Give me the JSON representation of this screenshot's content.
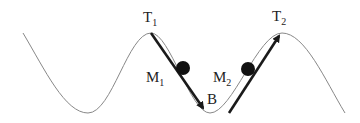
{
  "diagram": {
    "type": "physics-track",
    "labels": {
      "T1": {
        "main": "T",
        "sub": "1"
      },
      "T2": {
        "main": "T",
        "sub": "2"
      },
      "M1": {
        "main": "M",
        "sub": "1"
      },
      "M2": {
        "main": "M",
        "sub": "2"
      },
      "B": "B"
    },
    "colors": {
      "curve": "#888888",
      "arrow": "#1a1a1a",
      "ball": "#111111",
      "text": "#222222"
    },
    "elements": [
      {
        "id": "track-curve",
        "description": "sinusoidal track with two peaks T1, T2 and valley B"
      },
      {
        "id": "ball-M1",
        "description": "ball descending from T1 toward B",
        "arrow": "down-right"
      },
      {
        "id": "ball-M2",
        "description": "ball ascending from B toward T2",
        "arrow": "up-right"
      }
    ]
  }
}
